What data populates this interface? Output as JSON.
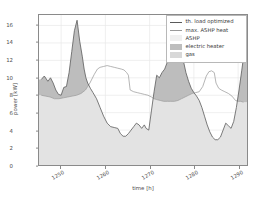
{
  "chart_data": {
    "type": "area",
    "title": "",
    "xlabel": "time [h]",
    "ylabel": "power [kW]",
    "xlim": [
      1245,
      1292
    ],
    "ylim": [
      0,
      17.2
    ],
    "xticks": [
      1250,
      1260,
      1270,
      1280,
      1290
    ],
    "xticklabels": [
      "1250",
      "1260",
      "1270",
      "1280",
      "1290"
    ],
    "yticks": [
      0,
      2,
      4,
      6,
      8,
      10,
      12,
      14,
      16
    ],
    "yticklabels": [
      "0",
      "2",
      "4",
      "6",
      "8",
      "10",
      "12",
      "14",
      "16"
    ],
    "grid": true,
    "legend_position": "upper right",
    "colors": {
      "th_load_optimized": "#5a5a5a",
      "max_ashp_heat": "#9a9a9a",
      "ashp_fill": "#e3e3e3",
      "electric_heater_fill": "#bdbdbd",
      "gas_fill": "#dddddd",
      "axis": "#8a8a8a",
      "grid": "#e8e8e8",
      "text": "#4d4d4d",
      "background": "#ffffff"
    },
    "series": [
      {
        "name": "th. load optimized",
        "kind": "line",
        "x": [
          1245.5,
          1246.2,
          1247.0,
          1247.6,
          1248.2,
          1248.8,
          1249.4,
          1250.0,
          1250.6,
          1251.2,
          1251.8,
          1252.4,
          1253.0,
          1253.6,
          1254.2,
          1254.8,
          1255.2,
          1255.6,
          1256.0,
          1256.6,
          1257.2,
          1258.0,
          1258.8,
          1259.6,
          1260.4,
          1261.2,
          1262.0,
          1262.8,
          1263.4,
          1264.0,
          1264.6,
          1265.2,
          1265.8,
          1266.4,
          1267.0,
          1267.6,
          1268.2,
          1268.8,
          1269.2,
          1269.8,
          1270.4,
          1271.0,
          1271.6,
          1272.2,
          1272.8,
          1273.4,
          1274.0,
          1274.6,
          1275.2,
          1275.8,
          1276.4,
          1277.0,
          1277.6,
          1278.2,
          1278.8,
          1279.4,
          1280.0,
          1280.6,
          1281.2,
          1281.8,
          1282.4,
          1283.0,
          1283.6,
          1284.2,
          1284.8,
          1285.4,
          1286.0,
          1286.6,
          1287.2,
          1287.8,
          1288.4,
          1289.0,
          1289.6,
          1290.2,
          1290.8,
          1291.2
        ],
        "y": [
          9.8,
          10.2,
          9.6,
          10.0,
          9.4,
          8.6,
          8.1,
          8.0,
          8.9,
          9.0,
          10.6,
          13.0,
          15.4,
          16.6,
          14.2,
          12.4,
          11.0,
          10.0,
          9.4,
          8.8,
          8.3,
          7.6,
          6.6,
          5.6,
          4.8,
          4.4,
          4.3,
          4.2,
          3.6,
          3.3,
          3.3,
          3.6,
          4.0,
          4.4,
          4.8,
          4.6,
          4.2,
          4.6,
          4.2,
          4.0,
          6.2,
          8.4,
          10.3,
          10.0,
          10.6,
          11.0,
          11.8,
          12.0,
          12.8,
          13.8,
          15.1,
          13.6,
          12.0,
          10.6,
          9.6,
          8.8,
          8.3,
          7.9,
          7.4,
          6.6,
          5.6,
          4.6,
          3.8,
          3.2,
          2.9,
          2.9,
          3.2,
          4.0,
          4.8,
          4.5,
          4.2,
          5.0,
          6.6,
          8.6,
          10.8,
          12.3
        ]
      },
      {
        "name": "max. ASHP heat",
        "kind": "line",
        "x": [
          1245.5,
          1246.5,
          1247.5,
          1248.5,
          1249.5,
          1250.5,
          1251.5,
          1252.5,
          1253.5,
          1254.5,
          1255.5,
          1256.5,
          1257.5,
          1258.2,
          1258.8,
          1259.6,
          1260.4,
          1261.2,
          1262.0,
          1262.8,
          1263.6,
          1264.2,
          1264.8,
          1265.2,
          1265.6,
          1266.4,
          1267.2,
          1268.0,
          1268.8,
          1269.6,
          1270.4,
          1271.0,
          1271.6,
          1272.4,
          1273.2,
          1274.0,
          1274.8,
          1275.6,
          1276.4,
          1277.2,
          1278.0,
          1278.8,
          1279.6,
          1280.4,
          1281.2,
          1282.0,
          1282.8,
          1283.4,
          1284.0,
          1284.6,
          1285.0,
          1285.6,
          1286.2,
          1287.0,
          1287.8,
          1288.6,
          1289.4,
          1290.0,
          1290.6,
          1291.2
        ],
        "y": [
          8.0,
          7.9,
          7.8,
          7.6,
          7.6,
          7.7,
          7.8,
          7.9,
          8.0,
          8.2,
          8.6,
          9.4,
          10.4,
          11.0,
          11.2,
          11.3,
          11.4,
          11.3,
          11.2,
          11.1,
          11.0,
          10.9,
          10.6,
          10.3,
          8.6,
          8.4,
          8.3,
          8.2,
          8.1,
          8.0,
          7.8,
          7.6,
          7.5,
          7.4,
          7.3,
          7.3,
          7.3,
          7.3,
          7.4,
          7.6,
          7.8,
          8.0,
          8.2,
          8.3,
          8.4,
          9.0,
          10.2,
          10.7,
          10.8,
          10.6,
          9.4,
          8.8,
          8.6,
          8.4,
          8.2,
          7.9,
          7.4,
          7.3,
          7.3,
          7.2
        ]
      }
    ],
    "fills": [
      {
        "name": "ASHP",
        "description": "light gray area from 0 up to min(th. load optimized, max. ASHP heat)",
        "color": "#e3e3e3"
      },
      {
        "name": "electric heater",
        "description": "darker gray area between max. ASHP heat and th. load optimized where load exceeds ASHP capacity",
        "color": "#bdbdbd"
      },
      {
        "name": "gas",
        "description": "gas contribution fill, not visible in this window",
        "color": "#dddddd"
      }
    ],
    "legend": [
      {
        "label": "th. load optimized",
        "type": "line",
        "color": "#5a5a5a"
      },
      {
        "label": "max. ASHP heat",
        "type": "line",
        "color": "#9a9a9a"
      },
      {
        "label": "ASHP",
        "type": "patch",
        "color": "#f0f0f0"
      },
      {
        "label": "electric heater",
        "type": "patch",
        "color": "#bdbdbd"
      },
      {
        "label": "gas",
        "type": "patch",
        "color": "#d8d8d8"
      }
    ]
  }
}
